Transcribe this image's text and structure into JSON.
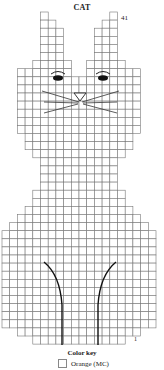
{
  "title": "CAT",
  "row_labels": {
    "top": "41",
    "bottom": "1"
  },
  "grid": {
    "origin_x": 2,
    "origin_y": 12,
    "cell_w": 7.7,
    "cell_h": 8.1,
    "line_color": "#777777",
    "rows_top_to_bottom": [
      [
        [
          5,
          5
        ],
        [
          14,
          14
        ]
      ],
      [
        [
          5,
          6
        ],
        [
          13,
          14
        ]
      ],
      [
        [
          5,
          7
        ],
        [
          12,
          14
        ]
      ],
      [
        [
          5,
          7
        ],
        [
          12,
          14
        ]
      ],
      [
        [
          5,
          7
        ],
        [
          12,
          14
        ]
      ],
      [
        [
          5,
          7
        ],
        [
          12,
          14
        ]
      ],
      [
        [
          4,
          8
        ],
        [
          11,
          15
        ]
      ],
      [
        [
          2,
          8
        ],
        [
          11,
          17
        ]
      ],
      [
        [
          2,
          9
        ],
        [
          10,
          17
        ]
      ],
      [
        [
          2,
          17
        ]
      ],
      [
        [
          2,
          17
        ]
      ],
      [
        [
          2,
          17
        ]
      ],
      [
        [
          2,
          17
        ]
      ],
      [
        [
          2,
          17
        ]
      ],
      [
        [
          2,
          17
        ]
      ],
      [
        [
          3,
          16
        ]
      ],
      [
        [
          3,
          16
        ]
      ],
      [
        [
          4,
          15
        ]
      ],
      [
        [
          5,
          14
        ]
      ],
      [
        [
          5,
          14
        ]
      ],
      [
        [
          5,
          14
        ]
      ],
      [
        [
          5,
          14
        ]
      ],
      [
        [
          4,
          15
        ]
      ],
      [
        [
          4,
          15
        ]
      ],
      [
        [
          3,
          16
        ]
      ],
      [
        [
          2,
          17
        ]
      ],
      [
        [
          1,
          18
        ]
      ],
      [
        [
          0,
          19
        ]
      ],
      [
        [
          0,
          19
        ]
      ],
      [
        [
          0,
          19
        ]
      ],
      [
        [
          0,
          19
        ]
      ],
      [
        [
          0,
          19
        ]
      ],
      [
        [
          0,
          19
        ]
      ],
      [
        [
          0,
          19
        ]
      ],
      [
        [
          0,
          19
        ]
      ],
      [
        [
          0,
          19
        ]
      ],
      [
        [
          0,
          19
        ]
      ],
      [
        [
          0,
          19
        ]
      ],
      [
        [
          0,
          19
        ]
      ],
      [
        [
          2,
          17
        ]
      ],
      [
        [
          4,
          15
        ]
      ]
    ]
  },
  "features": {
    "eyes": [
      {
        "cx": 58,
        "cy": 78
      },
      {
        "cx": 103,
        "cy": 78
      }
    ],
    "nose": {
      "x": 80,
      "y": 93
    },
    "whisker_color": "#333333",
    "leg_line_color": "#111111"
  },
  "color_key": {
    "title": "Color key",
    "items": [
      {
        "label": "Orange (MC)",
        "color": "#ffffff"
      }
    ]
  }
}
